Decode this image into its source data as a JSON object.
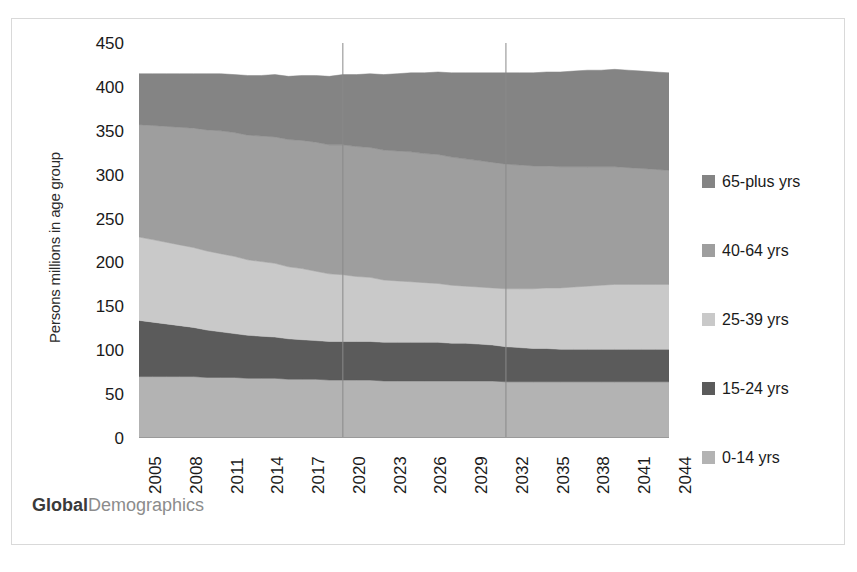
{
  "watermark": {
    "bold_part": "Global",
    "light_part": "Demographics"
  },
  "legend": {
    "position": "right",
    "entries": [
      {
        "label": "65-plus yrs",
        "color": "#848484",
        "swatch": "legend-swatch"
      },
      {
        "label": "40-64 yrs",
        "color": "#9e9e9e",
        "swatch": "legend-swatch"
      },
      {
        "label": "25-39 yrs",
        "color": "#c9c9c9",
        "swatch": "legend-swatch"
      },
      {
        "label": "15-24 yrs",
        "color": "#5b5b5b",
        "swatch": "legend-swatch"
      },
      {
        "label": "0-14 yrs",
        "color": "#b3b3b3",
        "swatch": "legend-swatch"
      }
    ]
  },
  "chart_data": {
    "type": "area",
    "stacked": true,
    "title": "",
    "subtitle": "",
    "xlabel": "",
    "ylabel": "Persons millions in age group",
    "ylim": [
      0,
      450
    ],
    "ytick_step": 50,
    "yticks": [
      "450",
      "400",
      "350",
      "300",
      "250",
      "200",
      "150",
      "100",
      "50",
      "0"
    ],
    "grid": "vertical-gridlines-at-2020-and-2032",
    "gridline_years": [
      2020,
      2032
    ],
    "x": [
      2005,
      2006,
      2007,
      2008,
      2009,
      2010,
      2011,
      2012,
      2013,
      2014,
      2015,
      2016,
      2017,
      2018,
      2019,
      2020,
      2021,
      2022,
      2023,
      2024,
      2025,
      2026,
      2027,
      2028,
      2029,
      2030,
      2031,
      2032,
      2033,
      2034,
      2035,
      2036,
      2037,
      2038,
      2039,
      2040,
      2041,
      2042,
      2043,
      2044
    ],
    "xtick_labels": [
      "2005",
      "2008",
      "2011",
      "2014",
      "2017",
      "2020",
      "2023",
      "2026",
      "2029",
      "2032",
      "2035",
      "2038",
      "2041",
      "2044"
    ],
    "xtick_rotation": 90,
    "series": [
      {
        "name": "0-14 yrs",
        "color": "#b3b3b3",
        "values": [
          70,
          70,
          70,
          70,
          70,
          69,
          69,
          69,
          68,
          68,
          68,
          67,
          67,
          67,
          66,
          66,
          66,
          66,
          65,
          65,
          65,
          65,
          65,
          65,
          65,
          65,
          65,
          64,
          64,
          64,
          64,
          64,
          64,
          64,
          64,
          64,
          64,
          64,
          64,
          64
        ]
      },
      {
        "name": "15-24 yrs",
        "color": "#5b5b5b",
        "values": [
          64,
          62,
          60,
          58,
          56,
          54,
          52,
          50,
          49,
          48,
          47,
          46,
          45,
          44,
          44,
          44,
          44,
          44,
          44,
          44,
          44,
          44,
          44,
          43,
          43,
          42,
          41,
          40,
          39,
          38,
          38,
          37,
          37,
          37,
          37,
          37,
          37,
          37,
          37,
          37
        ]
      },
      {
        "name": "25-39 yrs",
        "color": "#c9c9c9",
        "values": [
          95,
          94,
          93,
          92,
          91,
          90,
          89,
          88,
          86,
          85,
          84,
          82,
          81,
          79,
          77,
          76,
          74,
          73,
          71,
          70,
          69,
          68,
          67,
          66,
          65,
          65,
          65,
          66,
          67,
          68,
          69,
          70,
          71,
          72,
          73,
          74,
          74,
          74,
          74,
          74
        ]
      },
      {
        "name": "40-64 yrs",
        "color": "#9e9e9e",
        "values": [
          128,
          130,
          132,
          134,
          136,
          138,
          140,
          141,
          142,
          143,
          144,
          145,
          146,
          147,
          147,
          148,
          148,
          148,
          148,
          148,
          148,
          147,
          147,
          146,
          145,
          144,
          143,
          142,
          141,
          140,
          139,
          138,
          137,
          136,
          135,
          134,
          133,
          132,
          131,
          130
        ]
      },
      {
        "name": "65-plus yrs",
        "color": "#848484",
        "values": [
          58,
          59,
          60,
          61,
          62,
          64,
          65,
          66,
          68,
          69,
          71,
          72,
          74,
          76,
          78,
          80,
          82,
          84,
          86,
          88,
          90,
          92,
          94,
          96,
          98,
          100,
          102,
          104,
          105,
          106,
          107,
          108,
          109,
          110,
          110,
          111,
          111,
          111,
          111,
          111
        ]
      }
    ],
    "totals": [
      415,
      415,
      415,
      415,
      415,
      415,
      415,
      414,
      413,
      413,
      414,
      412,
      413,
      413,
      412,
      414,
      414,
      415,
      414,
      415,
      416,
      416,
      417,
      416,
      416,
      416,
      416,
      416,
      416,
      416,
      417,
      417,
      418,
      419,
      419,
      420,
      419,
      418,
      417,
      416
    ]
  }
}
